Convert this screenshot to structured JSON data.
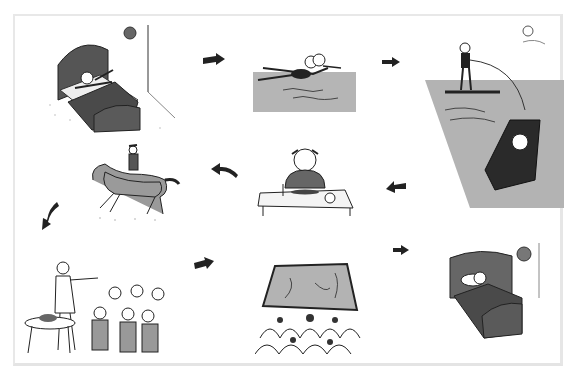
{
  "figure": {
    "type": "picture story sequence",
    "layout": "3x3 grid of cartoon illustrations connected by arrows",
    "colors": {
      "fill_gray": "#a9a9a9",
      "dark_gray": "#4a4a4a",
      "ink": "#1a1a1a",
      "border": "#e6e6e6"
    },
    "panels": [
      {
        "id": 1,
        "scene": "person waking up and stretching in bed, clock on wall"
      },
      {
        "id": 2,
        "scene": "person swimming in water"
      },
      {
        "id": 3,
        "scene": "person water-skiing pulled by a motorboat, sun in sky"
      },
      {
        "id": 4,
        "scene": "person riding a galloping horse"
      },
      {
        "id": 5,
        "scene": "girl eating a meal at a table with glass and apple"
      },
      {
        "id": 6,
        "scene": "waiter serving a group seated at restaurant table"
      },
      {
        "id": 7,
        "scene": "audience watching a movie screen in cinema"
      },
      {
        "id": 8,
        "scene": "person sleeping in bed, clock on wall"
      }
    ],
    "arrows": [
      {
        "from": 1,
        "to": 2,
        "direction": "right"
      },
      {
        "from": 2,
        "to": 3,
        "direction": "right"
      },
      {
        "from": 3,
        "to": 5,
        "direction": "left"
      },
      {
        "from": 5,
        "to": 4,
        "direction": "left"
      },
      {
        "from": 4,
        "to": 6,
        "direction": "down-left"
      },
      {
        "from": 6,
        "to": 7,
        "direction": "right"
      },
      {
        "from": 7,
        "to": 8,
        "direction": "right"
      }
    ]
  }
}
